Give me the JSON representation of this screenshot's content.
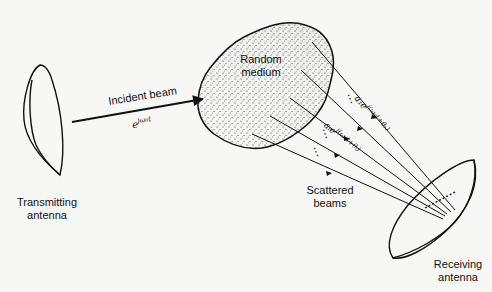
{
  "diagram": {
    "transmitter": {
      "label_line1": "Transmitting",
      "label_line2": "antenna"
    },
    "receiver": {
      "label_line1": "Receiving",
      "label_line2": "antenna"
    },
    "medium": {
      "label_line1": "Random",
      "label_line2": "medium"
    },
    "incident_beam": {
      "label": "Incident beam",
      "expression": "e^{jω₀t}",
      "expression_base": "e",
      "expression_exp": "jω₀t"
    },
    "scattered": {
      "label_line1": "Scattered",
      "label_line2": "beams",
      "beam_1_expression": "a₁e^{j(ω₀t+θ₁)}",
      "beam_1_text": "a₁e",
      "beam_1_exp": "j(ω₀t+θ₁)",
      "beam_i_expression": "aᵢe^{j(ω₀t+θᵢ)}",
      "beam_i_text": "aᵢe",
      "beam_i_exp": "j(ω₀t+θᵢ)",
      "ellipsis": "⋮"
    },
    "colors": {
      "ink": "#111111",
      "background": "#f7f7f5",
      "stipple": "#333333"
    }
  }
}
